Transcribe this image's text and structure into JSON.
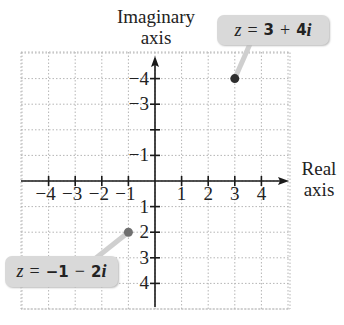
{
  "chart_data": {
    "type": "scatter",
    "xlabel": "Real axis",
    "ylabel": "Imaginary axis",
    "xlim": [
      -5,
      5
    ],
    "ylim": [
      -5,
      5
    ],
    "grid": true,
    "x_ticks": [
      -4,
      -3,
      -2,
      -1,
      1,
      2,
      3,
      4
    ],
    "y_ticks": [
      -4,
      -3,
      -2,
      -1,
      1,
      2,
      3,
      4
    ],
    "points": [
      {
        "x": 3,
        "y": 4,
        "label": "z = 3 + 4i",
        "color": "#2e2e2e"
      },
      {
        "x": -1,
        "y": -2,
        "label": "z = -1 - 2i",
        "color": "#707070"
      }
    ]
  },
  "labels": {
    "y_axis_line1": "Imaginary",
    "y_axis_line2": "axis",
    "x_axis_line1": "Real",
    "x_axis_line2": "axis",
    "x_ticks": [
      "−4",
      "−3",
      "−2",
      "−1",
      "1",
      "2",
      "3",
      "4"
    ],
    "y_ticks": [
      "4",
      "3",
      "2",
      "1",
      "−1",
      "",
      "−3",
      "−4"
    ]
  },
  "callouts": {
    "p1": {
      "z": "z",
      "eq": "=",
      "real": "3",
      "op": "+",
      "imag": "4",
      "i": "i"
    },
    "p2": {
      "z": "z",
      "eq": "=",
      "real": "−1",
      "op": "−",
      "imag": "2",
      "i": "i"
    }
  }
}
